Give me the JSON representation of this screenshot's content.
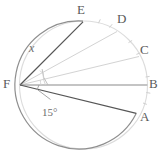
{
  "figure": {
    "type": "geometry-diagram",
    "colors": {
      "circle_stroke": "#8c8c8c",
      "circle_stroke_light": "#d8d8d8",
      "chord_dark": "#555555",
      "ray_light": "#d0d0d0",
      "arc_mark": "#c9c9c9",
      "text": "#5a5a5a",
      "background": "#ffffff"
    },
    "circle": {
      "center_x": 83.5,
      "center_y": 85,
      "radius": 64
    },
    "points": [
      {
        "name": "E",
        "label": "E",
        "x": 83,
        "y": 22,
        "label_x": 77,
        "label_y": 3
      },
      {
        "name": "D",
        "label": "D",
        "x": 117,
        "y": 31,
        "label_x": 117,
        "label_y": 12
      },
      {
        "name": "C",
        "label": "C",
        "x": 139,
        "y": 56,
        "label_x": 140,
        "label_y": 43
      },
      {
        "name": "B",
        "label": "B",
        "x": 147,
        "y": 85,
        "label_x": 149,
        "label_y": 77
      },
      {
        "name": "A",
        "label": "A",
        "x": 136,
        "y": 113,
        "label_x": 140,
        "label_y": 110
      },
      {
        "name": "F",
        "label": "F",
        "x": 20,
        "y": 85,
        "label_x": 3,
        "label_y": 77
      }
    ],
    "angle_labels": [
      {
        "name": "x",
        "text": "x",
        "x": 29,
        "y": 42,
        "italic": true
      },
      {
        "name": "15deg",
        "text": "15°",
        "x": 42,
        "y": 107,
        "italic": false
      }
    ],
    "rays": [
      {
        "from": "F",
        "to": "E",
        "style": "dark"
      },
      {
        "from": "F",
        "to": "D",
        "style": "light"
      },
      {
        "from": "F",
        "to": "C",
        "style": "light"
      },
      {
        "from": "F",
        "to": "B",
        "style": "dark"
      },
      {
        "from": "F",
        "to": "A",
        "style": "dark"
      }
    ]
  }
}
